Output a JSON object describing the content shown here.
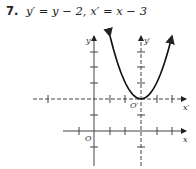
{
  "problem": {
    "number": "7.",
    "equation": "y′ = y − 2, x′ = x − 3"
  },
  "figure": {
    "labels": {
      "y_axis": "y",
      "y_prime_axis": "y′",
      "x_axis": "x",
      "x_prime_axis": "x′",
      "origin": "O",
      "origin_prime": "O′"
    }
  }
}
